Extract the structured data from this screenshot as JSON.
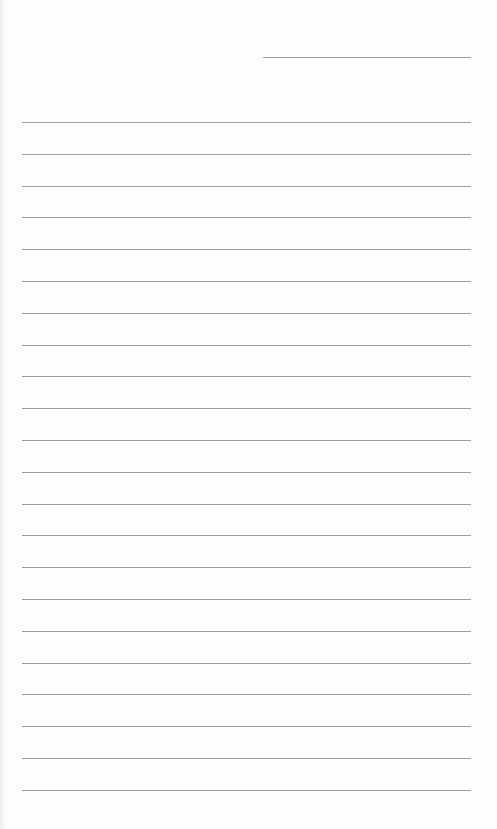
{
  "page": {
    "type": "lined-paper",
    "background_color": "#fdfdfd",
    "line_color": "#9c9c9c",
    "header_line": {
      "present": true
    },
    "ruled_line_count": 22
  }
}
